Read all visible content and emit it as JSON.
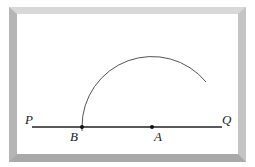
{
  "diagram": {
    "type": "geometry-construction",
    "labels": {
      "P": "P",
      "Q": "Q",
      "B": "B",
      "A": "A"
    },
    "points": {
      "P": {
        "x": 32,
        "y": 127
      },
      "Q": {
        "x": 222,
        "y": 127
      },
      "B": {
        "x": 82,
        "y": 127
      },
      "A": {
        "x": 152,
        "y": 127
      }
    },
    "arc": {
      "center": "A",
      "radius": 70,
      "from": "B",
      "to_point": {
        "x": 206,
        "y": 82
      }
    },
    "colors": {
      "line": "#222222",
      "arc": "#555555",
      "frame": "#c0c0c0"
    }
  }
}
